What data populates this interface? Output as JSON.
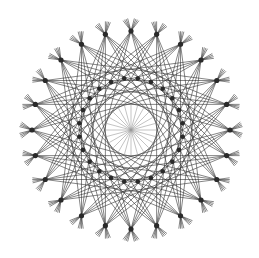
{
  "figure": {
    "name": "string-art-rosette",
    "width": 259,
    "height": 258,
    "center": [
      131,
      130
    ],
    "background": "#ffffff",
    "outer_nodes": {
      "count": 24,
      "radius": 99,
      "dot_radius": 2.6,
      "color": "#2a2a2a"
    },
    "chords": {
      "skips": [
        7,
        8,
        9,
        10
      ],
      "extend": 13,
      "color": "#333333",
      "width": 0.7,
      "opacity": 0.85
    },
    "inner_nodes": {
      "count": 24,
      "radius": 52,
      "dot_radius": 2.3,
      "color": "#2a2a2a",
      "offset_deg": 7.5
    },
    "center_spokes": {
      "count": 24,
      "radius": 25,
      "color": "#9a9a9a",
      "width": 0.6
    }
  }
}
